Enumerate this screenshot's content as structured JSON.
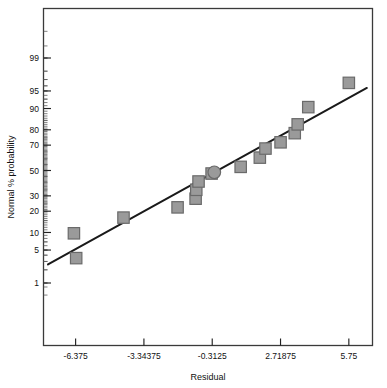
{
  "chart_data": {
    "type": "scatter",
    "title": "",
    "xlabel": "Residual",
    "ylabel": "Normal % probability",
    "grid": false,
    "legend": "none",
    "x_ticks": [
      "-6.375",
      "-3.34375",
      "-0.3125",
      "2.71875",
      "5.75"
    ],
    "x_tick_values": [
      -6.375,
      -3.34375,
      -0.3125,
      2.71875,
      5.75
    ],
    "xlim": [
      -7.8,
      6.8
    ],
    "y_ticks": [
      "99",
      "95",
      "90",
      "80",
      "70",
      "50",
      "30",
      "20",
      "10",
      "5",
      "1"
    ],
    "y_tick_values": [
      99,
      95,
      90,
      80,
      70,
      50,
      30,
      20,
      10,
      5,
      1
    ],
    "y_scale": "normal-probability",
    "ylim": [
      0.35,
      99.9
    ],
    "marker_color": "#9a9a9a",
    "marker_edge_color": "#6a6a6a",
    "line_color": "#1a1a1a",
    "points": [
      {
        "x": -6.35,
        "y": 3.5,
        "shape": "square"
      },
      {
        "x": -6.45,
        "y": 9.7,
        "shape": "square"
      },
      {
        "x": -4.25,
        "y": 16.5,
        "shape": "square"
      },
      {
        "x": -1.85,
        "y": 22.3,
        "shape": "square"
      },
      {
        "x": -1.05,
        "y": 28.0,
        "shape": "square"
      },
      {
        "x": -1.02,
        "y": 34.5,
        "shape": "square"
      },
      {
        "x": -0.92,
        "y": 41.0,
        "shape": "square"
      },
      {
        "x": -0.34,
        "y": 47.5,
        "shape": "square"
      },
      {
        "x": -0.22,
        "y": 48.5,
        "shape": "circle"
      },
      {
        "x": 0.95,
        "y": 53.0,
        "shape": "square"
      },
      {
        "x": 1.8,
        "y": 60.5,
        "shape": "square"
      },
      {
        "x": 2.05,
        "y": 67.5,
        "shape": "square"
      },
      {
        "x": 2.72,
        "y": 72.0,
        "shape": "square"
      },
      {
        "x": 3.35,
        "y": 78.0,
        "shape": "square"
      },
      {
        "x": 3.48,
        "y": 83.0,
        "shape": "square"
      },
      {
        "x": 3.95,
        "y": 90.5,
        "shape": "square"
      },
      {
        "x": 5.75,
        "y": 96.5,
        "shape": "square"
      }
    ],
    "fit_line": {
      "x0": -7.6,
      "y0": 2.6,
      "x1": 6.55,
      "y1": 95.6
    }
  }
}
